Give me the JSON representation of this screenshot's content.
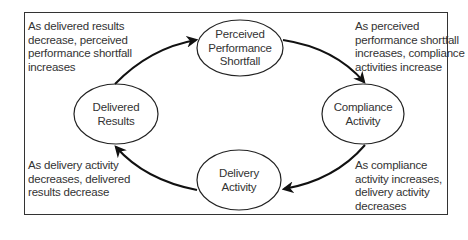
{
  "nodes": [
    {
      "id": "perceived",
      "label_lines": [
        "Perceived",
        "Performance",
        "Shortfall"
      ]
    },
    {
      "id": "compliance",
      "label_lines": [
        "Compliance",
        "Activity"
      ]
    },
    {
      "id": "delivery",
      "label_lines": [
        "Delivery",
        "Activity"
      ]
    },
    {
      "id": "delivered",
      "label_lines": [
        "Delivered",
        "Results"
      ]
    }
  ],
  "notes": {
    "top_left": [
      "As delivered results",
      "decrease, perceived",
      "performance shortfall",
      "increases"
    ],
    "top_right": [
      "As perceived",
      "performance shortfall",
      "increases, compliance",
      "activities increase"
    ],
    "bottom_right": [
      "As compliance",
      "activity increases,",
      "delivery activity",
      "decreases"
    ],
    "bottom_left": [
      "As delivery activity",
      "decreases, delivered",
      "results decrease"
    ]
  },
  "colors": {
    "line": "#222222",
    "text": "#333333",
    "background": "#ffffff"
  }
}
